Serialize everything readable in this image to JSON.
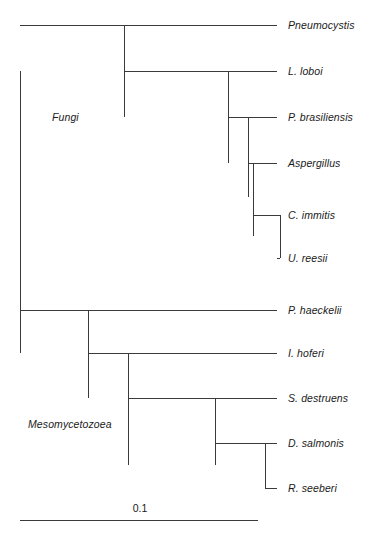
{
  "figure": {
    "type": "phylogenetic-tree",
    "orientation": "rectangular-horizontal",
    "width": 379,
    "height": 534,
    "background_color": "#ffffff",
    "line_color": "#3a3a3a"
  },
  "taxa": [
    {
      "id": "pneumocystis",
      "label": "Pneumocystis",
      "x_tip": 277,
      "y": 25,
      "x_start": 124
    },
    {
      "id": "l-loboi",
      "label": "L. loboi",
      "x_tip": 277,
      "y": 71,
      "x_start": 228
    },
    {
      "id": "p-brasiliensis",
      "label": "P. brasiliensis",
      "x_tip": 277,
      "y": 117,
      "x_start": 248
    },
    {
      "id": "aspergillus",
      "label": "Aspergillus",
      "x_tip": 277,
      "y": 163,
      "x_start": 253
    },
    {
      "id": "c-immitis",
      "label": "C. immitis",
      "x_tip": 277,
      "y": 215,
      "x_start": 280
    },
    {
      "id": "u-reesii",
      "label": "U. reesii",
      "x_tip": 277,
      "y": 258,
      "x_start": 280
    },
    {
      "id": "p-haeckelii",
      "label": "P. haeckelii",
      "x_tip": 277,
      "y": 310,
      "x_start": 88
    },
    {
      "id": "i-hoferi",
      "label": "I. hoferi",
      "x_tip": 277,
      "y": 353,
      "x_start": 128
    },
    {
      "id": "s-destruens",
      "label": "S. destruens",
      "x_tip": 277,
      "y": 398,
      "x_start": 215
    },
    {
      "id": "d-salmonis",
      "label": "D. salmonis",
      "x_tip": 277,
      "y": 443,
      "x_start": 265
    },
    {
      "id": "r-seeberi",
      "label": "R. seeberi",
      "x_tip": 277,
      "y": 488,
      "x_start": 265
    }
  ],
  "label_x": 288,
  "clade_labels": [
    {
      "id": "fungi",
      "label": "Fungi",
      "x": 52,
      "y": 117
    },
    {
      "id": "mesomycetozoea",
      "label": "Mesomycetozoea",
      "x": 28,
      "y": 424
    }
  ],
  "internal_nodes": [
    {
      "id": "root",
      "x": 20,
      "y_top": 71,
      "y_bottom": 353,
      "x_parent": 20
    },
    {
      "id": "fungi-node",
      "x": 124,
      "y_top": 25,
      "y_bottom": 117,
      "x_parent": 20
    },
    {
      "id": "l-loboi-node",
      "x": 228,
      "y_top": 71,
      "y_bottom": 163,
      "x_parent": 124
    },
    {
      "id": "p-bras-node",
      "x": 248,
      "y_top": 117,
      "y_bottom": 197,
      "x_parent": 228
    },
    {
      "id": "asper-node",
      "x": 253,
      "y_top": 163,
      "y_bottom": 236,
      "x_parent": 248
    },
    {
      "id": "immitis-node",
      "x": 280,
      "y_top": 215,
      "y_bottom": 258,
      "x_parent": 253
    },
    {
      "id": "meso-node",
      "x": 88,
      "y_top": 310,
      "y_bottom": 398,
      "x_parent": 20
    },
    {
      "id": "hoferi-node",
      "x": 128,
      "y_top": 353,
      "y_bottom": 465,
      "x_parent": 88
    },
    {
      "id": "destruens-node",
      "x": 215,
      "y_top": 398,
      "y_bottom": 465,
      "x_parent": 128
    },
    {
      "id": "salmonis-node",
      "x": 265,
      "y_top": 443,
      "y_bottom": 488,
      "x_parent": 215
    }
  ],
  "scale_bar": {
    "label": "0.1",
    "x_start": 20,
    "x_end": 258,
    "y": 520,
    "label_x": 140,
    "label_y": 508
  }
}
